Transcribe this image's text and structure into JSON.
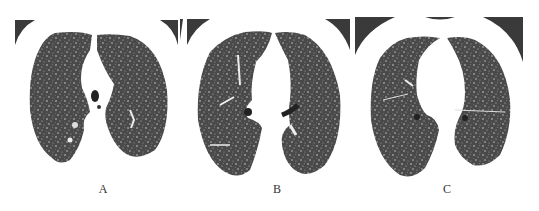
{
  "figure": {
    "panels": [
      {
        "id": "A",
        "label": "A",
        "description": "Axial chest CT, lung window, upper lobe level with diffuse small nodules"
      },
      {
        "id": "B",
        "label": "B",
        "description": "Axial chest CT, lung window, hilar level with diffuse small nodules"
      },
      {
        "id": "C",
        "label": "C",
        "description": "Axial chest CT, lung window, lower hilar level with diffuse small nodules"
      }
    ],
    "colors": {
      "background": "#ffffff",
      "lung_parenchyma": "#4a4a4a",
      "nodule_speckle": "#d8d8d8",
      "corner_artifact": "#3a3a3a"
    }
  }
}
